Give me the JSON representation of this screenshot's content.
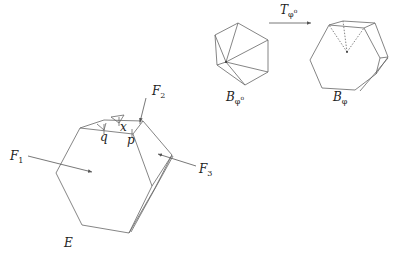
{
  "figure": {
    "type": "geometric-diagram",
    "colors": {
      "stroke": "#666666",
      "text": "#222222",
      "background": "#ffffff"
    },
    "panels": {
      "source_polygon": {
        "label_main": "B",
        "label_sub": "φ",
        "label_sup": "o",
        "description": "Hexagon triangulated from an interior point"
      },
      "map_arrow": {
        "label_main": "T",
        "label_sub": "φ",
        "label_sup": "o"
      },
      "target_polyhedron": {
        "label_main": "B",
        "label_sub": "φ",
        "description": "Polyhedron with dotted hidden edges meeting at interior point"
      },
      "main_polyhedron": {
        "label": "E",
        "face_labels": [
          {
            "main": "F",
            "sub": "1"
          },
          {
            "main": "F",
            "sub": "2"
          },
          {
            "main": "F",
            "sub": "3"
          }
        ],
        "point_labels": [
          "q",
          "p",
          "x"
        ]
      }
    }
  }
}
